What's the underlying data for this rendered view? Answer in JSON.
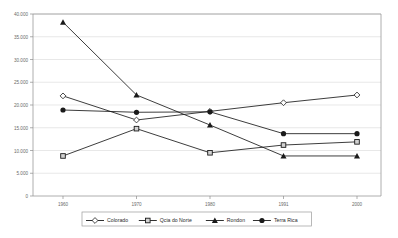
{
  "chart_data": {
    "type": "line",
    "title": "",
    "xlabel": "",
    "ylabel": "",
    "categories": [
      "1960",
      "1970",
      "1980",
      "1991",
      "2000"
    ],
    "ylim": [
      0,
      40000
    ],
    "ytick_labels": [
      "0",
      "5.000",
      "10.000",
      "15.000",
      "20.000",
      "25.000",
      "30.000",
      "35.000",
      "40.000"
    ],
    "ytick_values": [
      0,
      5000,
      10000,
      15000,
      20000,
      25000,
      30000,
      35000,
      40000
    ],
    "grid": true,
    "legend_position": "bottom",
    "series": [
      {
        "name": "Colorado",
        "marker": "diamond-open",
        "values": [
          22000,
          16700,
          18600,
          20500,
          22200
        ]
      },
      {
        "name": "Qcia do Norte",
        "marker": "square-open",
        "values": [
          8800,
          14800,
          9500,
          11200,
          11900
        ]
      },
      {
        "name": "Rondon",
        "marker": "triangle-filled",
        "values": [
          38200,
          22200,
          15600,
          8800,
          8800
        ]
      },
      {
        "name": "Terra Rica",
        "marker": "circle-filled",
        "values": [
          18900,
          18400,
          18500,
          13700,
          13700
        ]
      }
    ]
  },
  "legend": {
    "items": [
      {
        "label": "Colorado",
        "marker": "diamond-open"
      },
      {
        "label": "Qcia do Norte",
        "marker": "square-open"
      },
      {
        "label": "Rondon",
        "marker": "triangle-filled"
      },
      {
        "label": "Terra Rica",
        "marker": "circle-filled"
      }
    ]
  },
  "axis": {
    "y_labels": [
      "40.000",
      "35.000",
      "30.000",
      "25.000",
      "20.000",
      "15.000",
      "10.000",
      "5.000",
      "0"
    ],
    "x_labels": [
      "1960",
      "1970",
      "1980",
      "1991",
      "2000"
    ]
  },
  "colors": {
    "line": "#1a1a1a",
    "grid": "#d9d9d9",
    "axis": "#8c8c8c",
    "plot_background": "#ffffff",
    "tick_text": "#6a6a6a",
    "legend_text": "#2b2b2b"
  },
  "caption": {
    "text": ""
  }
}
